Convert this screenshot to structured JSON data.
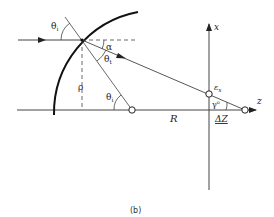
{
  "figure": {
    "caption": "(b)",
    "labels": {
      "theta_i_top": "θ",
      "theta_i_top_sub": "i",
      "alpha": "α",
      "theta_t": "θ",
      "theta_t_sub": "t",
      "rho": "ρ",
      "theta_i_bottom": "θ",
      "theta_i_bottom_sub": "i",
      "R": "R",
      "epsilon_x": "ε",
      "epsilon_x_sub": "x",
      "gamma": "γ",
      "gamma_sup": "o",
      "delta_z": "ΔZ",
      "x_axis": "x",
      "z_axis": "z"
    },
    "colors": {
      "line": "#333333",
      "background": "#ffffff"
    }
  }
}
